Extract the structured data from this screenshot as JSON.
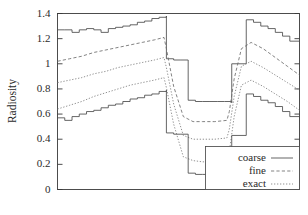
{
  "chart_data": {
    "type": "line",
    "title": "",
    "subtitle": "",
    "xlabel": "",
    "ylabel": "Radiosity",
    "xlim": [
      0,
      100
    ],
    "ylim": [
      0,
      1.4
    ],
    "grid": false,
    "xticks": [],
    "xticklabels": [],
    "yticks": [
      0,
      0.2,
      0.4,
      0.6,
      0.8,
      1.0,
      1.2,
      1.4
    ],
    "yticklabels": [
      "0",
      "0.2",
      "0.4",
      "0.6",
      "0.8",
      "1",
      "1.2",
      "1.4"
    ],
    "legend": {
      "position": "lower-right",
      "entries": [
        {
          "label": "coarse",
          "style": "solid"
        },
        {
          "label": "fine",
          "style": "dashed"
        },
        {
          "label": "exact",
          "style": "dotted"
        }
      ]
    },
    "series": [
      {
        "name": "coarse-upper",
        "style": "solid",
        "x": [
          0,
          3,
          6,
          9,
          12,
          15,
          18,
          21,
          24,
          27,
          30,
          33,
          36,
          39,
          42,
          45,
          45,
          48,
          51,
          54,
          57,
          60,
          63,
          66,
          69,
          72,
          72,
          75,
          78,
          81,
          84,
          87,
          90,
          93,
          96,
          100
        ],
        "y": [
          1.27,
          1.27,
          1.25,
          1.27,
          1.28,
          1.27,
          1.25,
          1.28,
          1.29,
          1.3,
          1.31,
          1.33,
          1.34,
          1.36,
          1.37,
          1.38,
          1.04,
          1.03,
          1.03,
          0.71,
          0.7,
          0.7,
          0.7,
          0.7,
          0.7,
          0.69,
          1.0,
          1.0,
          1.35,
          1.33,
          1.3,
          1.28,
          1.25,
          1.22,
          1.18,
          1.14
        ]
      },
      {
        "name": "fine-upper",
        "style": "dashed",
        "x": [
          0,
          5,
          10,
          15,
          20,
          25,
          30,
          35,
          40,
          44,
          45,
          48,
          52,
          56,
          60,
          65,
          70,
          71,
          73,
          76,
          80,
          85,
          90,
          95,
          100
        ],
        "y": [
          1.02,
          1.04,
          1.06,
          1.09,
          1.11,
          1.13,
          1.15,
          1.17,
          1.19,
          1.21,
          1.12,
          0.82,
          0.58,
          0.54,
          0.54,
          0.54,
          0.55,
          0.62,
          0.88,
          1.12,
          1.17,
          1.12,
          1.05,
          0.98,
          0.91
        ]
      },
      {
        "name": "exact-upper",
        "style": "dotted",
        "x": [
          0,
          5,
          10,
          15,
          20,
          25,
          30,
          35,
          40,
          44,
          45,
          48,
          52,
          56,
          60,
          65,
          70,
          71,
          73,
          76,
          80,
          85,
          90,
          95,
          100
        ],
        "y": [
          0.85,
          0.87,
          0.89,
          0.92,
          0.94,
          0.97,
          0.99,
          1.01,
          1.03,
          1.05,
          0.97,
          0.68,
          0.43,
          0.4,
          0.4,
          0.4,
          0.41,
          0.48,
          0.74,
          0.98,
          1.02,
          0.97,
          0.91,
          0.85,
          0.79
        ]
      },
      {
        "name": "exact-mid",
        "style": "dotted",
        "x": [
          0,
          5,
          10,
          15,
          20,
          25,
          30,
          35,
          40,
          44,
          45,
          48,
          52,
          56,
          60,
          65,
          70,
          71,
          73,
          76,
          80,
          85,
          90,
          95,
          100
        ],
        "y": [
          0.64,
          0.67,
          0.7,
          0.74,
          0.77,
          0.8,
          0.83,
          0.85,
          0.87,
          0.89,
          0.81,
          0.52,
          0.26,
          0.23,
          0.22,
          0.22,
          0.23,
          0.3,
          0.58,
          0.83,
          0.87,
          0.82,
          0.76,
          0.7,
          0.63
        ]
      },
      {
        "name": "coarse-lower",
        "style": "solid",
        "x": [
          0,
          3,
          6,
          9,
          12,
          15,
          18,
          21,
          24,
          27,
          30,
          33,
          36,
          39,
          42,
          45,
          45,
          48,
          51,
          54,
          57,
          60,
          63,
          66,
          69,
          72,
          72,
          75,
          78,
          81,
          84,
          87,
          90,
          93,
          96,
          100
        ],
        "y": [
          0.57,
          0.55,
          0.58,
          0.6,
          0.62,
          0.63,
          0.65,
          0.67,
          0.68,
          0.7,
          0.72,
          0.73,
          0.75,
          0.76,
          0.78,
          0.79,
          0.45,
          0.44,
          0.44,
          0.13,
          0.12,
          0.12,
          0.12,
          0.12,
          0.12,
          0.12,
          0.43,
          0.43,
          0.76,
          0.74,
          0.71,
          0.69,
          0.66,
          0.62,
          0.58,
          0.53
        ]
      }
    ]
  }
}
